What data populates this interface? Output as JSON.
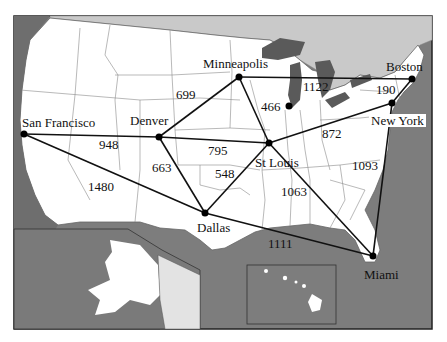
{
  "diagram": {
    "type": "weighted-graph-on-map",
    "colors": {
      "water": "#7a7a7a",
      "land_us": "#ffffff",
      "land_foreign": "#d9d9d9",
      "canada": "#c8c8c8",
      "lakes": "#5f5f5f",
      "border": "#777777",
      "edge": "#111111",
      "frame": "#222222"
    },
    "cities": [
      {
        "id": "sf",
        "name": "San Francisco",
        "x": 24,
        "y": 134
      },
      {
        "id": "den",
        "name": "Denver",
        "x": 159,
        "y": 137
      },
      {
        "id": "min",
        "name": "Minneapolis",
        "x": 239,
        "y": 77
      },
      {
        "id": "chi",
        "name": "",
        "x": 289,
        "y": 106
      },
      {
        "id": "bos",
        "name": "Boston",
        "x": 412,
        "y": 79
      },
      {
        "id": "ny",
        "name": "New York",
        "x": 392,
        "y": 103
      },
      {
        "id": "stl",
        "name": "St Louis",
        "x": 269,
        "y": 143
      },
      {
        "id": "dal",
        "name": "Dallas",
        "x": 205,
        "y": 213
      },
      {
        "id": "mia",
        "name": "Miami",
        "x": 373,
        "y": 256
      }
    ],
    "edges": [
      {
        "from": "sf",
        "to": "den",
        "weight": "948"
      },
      {
        "from": "sf",
        "to": "dal",
        "weight": "1480"
      },
      {
        "from": "den",
        "to": "min",
        "weight": "699"
      },
      {
        "from": "den",
        "to": "stl",
        "weight": "795"
      },
      {
        "from": "den",
        "to": "dal",
        "weight": "663"
      },
      {
        "from": "min",
        "to": "bos",
        "weight": "1122"
      },
      {
        "from": "min",
        "to": "stl",
        "weight": "466"
      },
      {
        "from": "bos",
        "to": "ny",
        "weight": "190"
      },
      {
        "from": "stl",
        "to": "ny",
        "weight": "872"
      },
      {
        "from": "stl",
        "to": "dal",
        "weight": "548"
      },
      {
        "from": "stl",
        "to": "mia",
        "weight": "1063"
      },
      {
        "from": "ny",
        "to": "mia",
        "weight": "1093"
      },
      {
        "from": "dal",
        "to": "mia",
        "weight": "1111"
      }
    ],
    "labels": {
      "san_francisco": "San Francisco",
      "denver": "Denver",
      "minneapolis": "Minneapolis",
      "boston": "Boston",
      "new_york": "New York",
      "st_louis": "St Louis",
      "dallas": "Dallas",
      "miami": "Miami"
    },
    "weights": {
      "sf_den": "948",
      "sf_dal": "1480",
      "den_min": "699",
      "den_stl": "795",
      "den_dal": "663",
      "min_bos": "1122",
      "min_stl": "466",
      "bos_ny": "190",
      "stl_ny": "872",
      "stl_dal": "548",
      "stl_mia": "1063",
      "ny_mia": "1093",
      "dal_mia": "1111"
    },
    "insets": [
      "alaska",
      "hawaii"
    ]
  }
}
